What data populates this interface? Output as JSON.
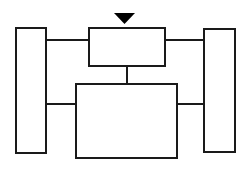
{
  "diagram": {
    "type": "block-diagram",
    "title": "",
    "canvas": {
      "width": 250,
      "height": 173,
      "background": "#ffffff"
    },
    "style": {
      "stroke_color": "#1a1a1a",
      "node_fill": "#ffffff",
      "node_stroke_width": 2,
      "connector_stroke_width": 2,
      "marker_fill": "#000000"
    },
    "nodes": [
      {
        "id": "left-block",
        "name": "left-vertical-block",
        "label": "",
        "shape": "rectangle",
        "x": 16,
        "y": 28,
        "width": 30,
        "height": 125
      },
      {
        "id": "top-center-block",
        "name": "top-center-block",
        "label": "",
        "shape": "rectangle",
        "x": 89,
        "y": 28,
        "width": 76,
        "height": 38
      },
      {
        "id": "bottom-center-block",
        "name": "bottom-center-block",
        "label": "",
        "shape": "rectangle",
        "x": 76,
        "y": 84,
        "width": 101,
        "height": 74
      },
      {
        "id": "right-block",
        "name": "right-vertical-block",
        "label": "",
        "shape": "rectangle",
        "x": 204,
        "y": 29,
        "width": 31,
        "height": 123
      }
    ],
    "connectors": [
      {
        "id": "c1",
        "name": "left-block-to-top-center-connector",
        "from": "left-block",
        "to": "top-center-block",
        "orientation": "horizontal",
        "x1": 45,
        "y1": 40,
        "x2": 90,
        "y2": 40
      },
      {
        "id": "c2",
        "name": "top-center-to-right-block-connector",
        "from": "top-center-block",
        "to": "right-block",
        "orientation": "horizontal",
        "x1": 164,
        "y1": 40,
        "x2": 205,
        "y2": 40
      },
      {
        "id": "c3",
        "name": "top-center-to-bottom-center-connector",
        "from": "top-center-block",
        "to": "bottom-center-block",
        "orientation": "vertical",
        "x1": 127,
        "y1": 65,
        "x2": 127,
        "y2": 85
      },
      {
        "id": "c4",
        "name": "left-block-to-bottom-center-connector",
        "from": "left-block",
        "to": "bottom-center-block",
        "orientation": "horizontal",
        "x1": 45,
        "y1": 104,
        "x2": 77,
        "y2": 104
      },
      {
        "id": "c5",
        "name": "bottom-center-to-right-block-connector",
        "from": "bottom-center-block",
        "to": "right-block",
        "orientation": "horizontal",
        "x1": 176,
        "y1": 104,
        "x2": 205,
        "y2": 104
      }
    ],
    "markers": [
      {
        "id": "m1",
        "name": "down-triangle-marker-icon",
        "shape": "triangle-down",
        "points": "114,13 135,13 124.5,24",
        "fill": "#000000",
        "target": "top-center-block"
      }
    ]
  }
}
